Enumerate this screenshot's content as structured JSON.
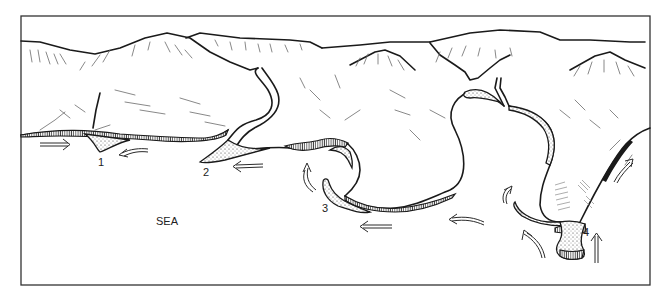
{
  "diagram": {
    "type": "coastal landforms sketch",
    "labels": {
      "sea": "SEA",
      "n1": "1",
      "n2": "2",
      "n3": "3",
      "n4": "4"
    },
    "colors": {
      "ink": "#1a1a1a",
      "background": "#ffffff"
    },
    "features": [
      {
        "id": "1",
        "description": "cuspate foreland / triangular deposit"
      },
      {
        "id": "2",
        "description": "spit at river mouth"
      },
      {
        "id": "3",
        "description": "recurved spit in bay"
      },
      {
        "id": "4",
        "description": "tombolo linking island to mainland"
      }
    ]
  }
}
